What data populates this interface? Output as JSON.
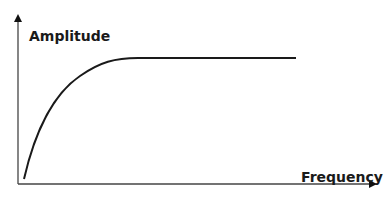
{
  "diagram": {
    "y_axis_label": "Amplitude",
    "x_axis_label": "Frequency",
    "curve_description": "rises steeply from origin then levels off to a flat plateau",
    "colors": {
      "line": "#1a1a1a",
      "axis": "#333333",
      "background": "#ffffff"
    }
  }
}
